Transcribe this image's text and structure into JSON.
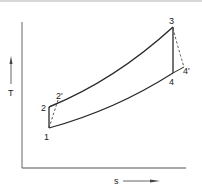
{
  "diagram": {
    "type": "T-s diagram",
    "axes": {
      "y_label": "T",
      "x_label": "s"
    },
    "points": [
      {
        "id": "1",
        "label": "1",
        "x": 49,
        "y": 128
      },
      {
        "id": "2",
        "label": "2",
        "x": 49,
        "y": 107
      },
      {
        "id": "2p",
        "label": "2'",
        "x": 58,
        "y": 100
      },
      {
        "id": "3",
        "label": "3",
        "x": 173,
        "y": 27
      },
      {
        "id": "4",
        "label": "4",
        "x": 173,
        "y": 73
      },
      {
        "id": "4p",
        "label": "4'",
        "x": 184,
        "y": 67
      }
    ],
    "paths": [
      {
        "from": "1",
        "to": "2",
        "style": "solid",
        "meaning": "isentropic compression"
      },
      {
        "from": "2",
        "to": "3",
        "style": "solid",
        "meaning": "heat addition (constant pressure)"
      },
      {
        "from": "3",
        "to": "4",
        "style": "solid",
        "meaning": "isentropic expansion"
      },
      {
        "from": "4",
        "to": "1",
        "style": "solid",
        "meaning": "heat rejection (constant pressure)"
      },
      {
        "from": "1",
        "to": "2p",
        "style": "dashed",
        "meaning": "actual compression"
      },
      {
        "from": "3",
        "to": "4p",
        "style": "dashed",
        "meaning": "actual expansion"
      },
      {
        "from": "4",
        "to": "4p",
        "style": "solid",
        "meaning": "constant pressure extension"
      }
    ],
    "colors": {
      "line": "#2a2a2a",
      "axis": "#555555",
      "text": "#222222"
    }
  }
}
